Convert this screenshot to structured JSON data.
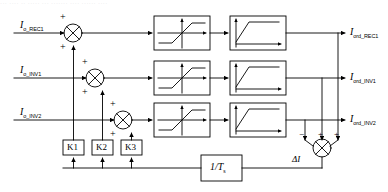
{
  "diagram": {
    "type": "control-block-diagram",
    "title_strip": "··· ···· ·· ····· ··· ······· ···· ······ ····",
    "background_color": "#ffffff",
    "line_color": "#000000"
  },
  "inputs": [
    {
      "name": "input-rec1",
      "symbol": "I",
      "subscript": "o_REC1"
    },
    {
      "name": "input-inv1",
      "symbol": "I",
      "subscript": "o_INV1"
    },
    {
      "name": "input-inv2",
      "symbol": "I",
      "subscript": "o_INV2"
    }
  ],
  "outputs": [
    {
      "name": "output-rec1",
      "symbol": "I",
      "subscript": "ord_REC1"
    },
    {
      "name": "output-inv1",
      "symbol": "I",
      "subscript": "ord_INV1"
    },
    {
      "name": "output-inv2",
      "symbol": "I",
      "subscript": "ord_INV2"
    }
  ],
  "gain_blocks": [
    {
      "name": "gain-k1",
      "label": "K1"
    },
    {
      "name": "gain-k2",
      "label": "K2"
    },
    {
      "name": "gain-k3",
      "label": "K3"
    }
  ],
  "feedback_block": {
    "name": "integrator-block",
    "numerator": "1/T",
    "subscript": "s"
  },
  "error_signal": {
    "name": "delta-i-label",
    "symbol": "ΔI"
  },
  "summing_junctions": [
    {
      "name": "sum-rec1",
      "signs": [
        {
          "position": "top",
          "sign": "+"
        },
        {
          "position": "bottom-left",
          "sign": "+"
        }
      ]
    },
    {
      "name": "sum-inv1",
      "signs": [
        {
          "position": "top",
          "sign": "+"
        },
        {
          "position": "bottom-left",
          "sign": "+"
        }
      ]
    },
    {
      "name": "sum-inv2",
      "signs": [
        {
          "position": "top",
          "sign": "+"
        },
        {
          "position": "bottom-left",
          "sign": "+"
        }
      ]
    },
    {
      "name": "sum-delta-i",
      "signs": [
        {
          "position": "left",
          "sign": "−"
        },
        {
          "position": "center",
          "sign": "+"
        },
        {
          "position": "right",
          "sign": "+"
        }
      ]
    }
  ],
  "limiter_blocks": [
    {
      "name": "limiter-rec1",
      "kind": "saturation"
    },
    {
      "name": "limiter-inv1",
      "kind": "saturation"
    },
    {
      "name": "limiter-inv2",
      "kind": "saturation"
    }
  ],
  "lag_blocks": [
    {
      "name": "lag-rec1",
      "kind": "first-order-lag"
    },
    {
      "name": "lag-inv1",
      "kind": "first-order-lag"
    },
    {
      "name": "lag-inv2",
      "kind": "first-order-lag"
    }
  ]
}
